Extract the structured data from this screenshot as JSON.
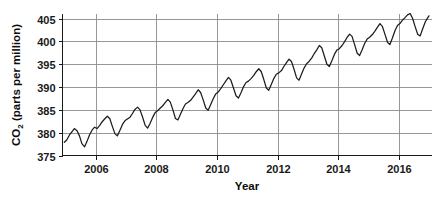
{
  "chart_data": {
    "type": "line",
    "title": "",
    "subtitle": "",
    "xlabel": "Year",
    "ylabel": "CO2 (parts per million)",
    "ylabel_parts": {
      "prefix": "CO",
      "subscript": "2",
      "suffix": " (parts per million)"
    },
    "grid": true,
    "legend": "none",
    "xlim": [
      2004.9,
      2017.1
    ],
    "ylim": [
      375,
      406
    ],
    "xticks": [
      2006,
      2008,
      2010,
      2012,
      2014,
      2016
    ],
    "xtick_labels": [
      "2006",
      "2008",
      "2010",
      "2012",
      "2014",
      "2016"
    ],
    "yticks": [
      375,
      380,
      385,
      390,
      395,
      400,
      405
    ],
    "ytick_labels": [
      "375",
      "380",
      "385",
      "390",
      "395",
      "400",
      "405"
    ],
    "series": [
      {
        "name": "Atmospheric CO2 (monthly mean)",
        "color": "#1c1c1c",
        "x": [
          2004.96,
          2005.04,
          2005.13,
          2005.21,
          2005.29,
          2005.38,
          2005.46,
          2005.54,
          2005.63,
          2005.71,
          2005.79,
          2005.88,
          2005.96,
          2006.04,
          2006.13,
          2006.21,
          2006.29,
          2006.38,
          2006.46,
          2006.54,
          2006.63,
          2006.71,
          2006.79,
          2006.88,
          2006.96,
          2007.04,
          2007.13,
          2007.21,
          2007.29,
          2007.38,
          2007.46,
          2007.54,
          2007.63,
          2007.71,
          2007.79,
          2007.88,
          2007.96,
          2008.04,
          2008.13,
          2008.21,
          2008.29,
          2008.38,
          2008.46,
          2008.54,
          2008.63,
          2008.71,
          2008.79,
          2008.88,
          2008.96,
          2009.04,
          2009.13,
          2009.21,
          2009.29,
          2009.38,
          2009.46,
          2009.54,
          2009.63,
          2009.71,
          2009.79,
          2009.88,
          2009.96,
          2010.04,
          2010.13,
          2010.21,
          2010.29,
          2010.38,
          2010.46,
          2010.54,
          2010.63,
          2010.71,
          2010.79,
          2010.88,
          2010.96,
          2011.04,
          2011.13,
          2011.21,
          2011.29,
          2011.38,
          2011.46,
          2011.54,
          2011.63,
          2011.71,
          2011.79,
          2011.88,
          2011.96,
          2012.04,
          2012.13,
          2012.21,
          2012.29,
          2012.38,
          2012.46,
          2012.54,
          2012.63,
          2012.71,
          2012.79,
          2012.88,
          2012.96,
          2013.04,
          2013.13,
          2013.21,
          2013.29,
          2013.38,
          2013.46,
          2013.54,
          2013.63,
          2013.71,
          2013.79,
          2013.88,
          2013.96,
          2014.04,
          2014.13,
          2014.21,
          2014.29,
          2014.38,
          2014.46,
          2014.54,
          2014.63,
          2014.71,
          2014.79,
          2014.88,
          2014.96,
          2015.04,
          2015.13,
          2015.21,
          2015.29,
          2015.38,
          2015.46,
          2015.54,
          2015.63,
          2015.71,
          2015.79,
          2015.88,
          2015.96,
          2016.04,
          2016.13,
          2016.21,
          2016.29,
          2016.38,
          2016.46,
          2016.54,
          2016.63,
          2016.71,
          2016.79,
          2016.88,
          2016.96,
          2017.0
        ],
        "y": [
          377.9,
          378.4,
          379.5,
          380.2,
          380.9,
          380.4,
          379.3,
          377.6,
          376.9,
          378.1,
          379.5,
          380.6,
          381.2,
          380.9,
          381.6,
          382.4,
          383.0,
          383.6,
          383.1,
          381.5,
          379.8,
          379.3,
          380.4,
          381.8,
          382.6,
          383.0,
          383.4,
          384.2,
          385.1,
          385.6,
          385.0,
          383.5,
          381.6,
          381.0,
          382.0,
          383.4,
          384.4,
          384.8,
          385.4,
          385.9,
          386.6,
          387.3,
          386.7,
          385.1,
          383.1,
          382.8,
          384.0,
          385.3,
          386.3,
          386.6,
          387.1,
          387.8,
          388.5,
          389.4,
          388.8,
          387.3,
          385.4,
          384.9,
          386.1,
          387.5,
          388.5,
          388.9,
          389.7,
          390.5,
          391.3,
          392.1,
          391.5,
          389.9,
          388.1,
          387.6,
          388.7,
          390.1,
          391.0,
          391.3,
          391.9,
          392.5,
          393.3,
          394.0,
          393.4,
          391.8,
          389.8,
          389.3,
          390.5,
          391.9,
          392.8,
          393.1,
          393.6,
          394.5,
          395.3,
          396.1,
          395.6,
          394.0,
          392.0,
          391.5,
          392.8,
          394.2,
          395.1,
          395.6,
          396.4,
          397.3,
          398.1,
          399.1,
          398.6,
          396.9,
          395.0,
          394.5,
          395.7,
          397.2,
          398.1,
          398.4,
          399.1,
          399.9,
          400.8,
          401.6,
          401.1,
          399.4,
          397.4,
          396.9,
          398.1,
          399.6,
          400.5,
          400.9,
          401.5,
          402.2,
          403.0,
          403.9,
          403.3,
          401.7,
          399.8,
          399.3,
          400.7,
          402.4,
          403.5,
          403.9,
          404.7,
          405.2,
          405.8,
          406.1,
          405.0,
          403.3,
          401.5,
          401.2,
          402.7,
          404.3,
          405.2,
          405.6
        ]
      }
    ]
  }
}
